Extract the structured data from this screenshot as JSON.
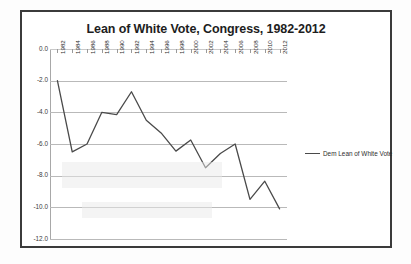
{
  "chart_data": {
    "type": "line",
    "title": "Lean of White Vote, Congress, 1982-2012",
    "xlabel": "",
    "ylabel": "",
    "categories": [
      "1982",
      "1984",
      "1986",
      "1988",
      "1990",
      "1992",
      "1994",
      "1996",
      "1998",
      "2000",
      "2002",
      "2004",
      "2006",
      "2008",
      "2010",
      "2012"
    ],
    "series": [
      {
        "name": "Dem Lean of White Vote",
        "values": [
          -2.0,
          -6.5,
          -6.0,
          -4.0,
          -4.15,
          -2.7,
          -4.5,
          -5.3,
          -6.45,
          -5.75,
          -7.5,
          -6.6,
          -6.0,
          -9.5,
          -8.35,
          -10.1
        ],
        "color": "#4a4a4a"
      }
    ],
    "ylim": [
      -12.0,
      0.0
    ],
    "y_ticks": [
      "0.0",
      "-2.0",
      "-4.0",
      "-6.0",
      "-8.0",
      "-10.0",
      "-12.0"
    ],
    "y_tick_values": [
      0.0,
      -2.0,
      -4.0,
      -6.0,
      -8.0,
      -10.0,
      -12.0
    ],
    "grid": true,
    "legend_position": "right"
  },
  "legend": {
    "entries": [
      {
        "label": "Dem Lean of White Vote",
        "color": "#4a4a4a"
      }
    ]
  },
  "colors": {
    "frame": "#3b3b3b",
    "gridline": "#b9b9b9",
    "series": "#4a4a4a",
    "text": "#1d1d1d",
    "background": "#ffffff"
  }
}
